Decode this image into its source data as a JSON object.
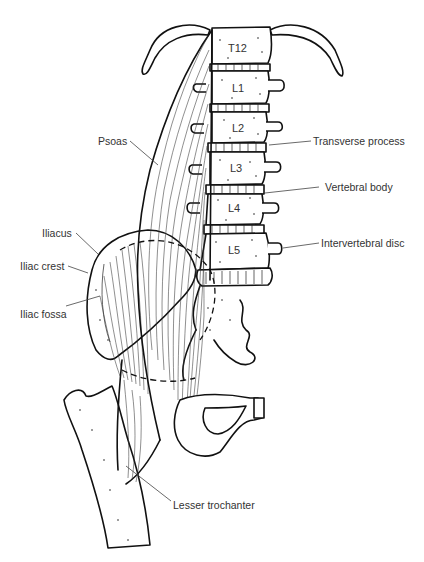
{
  "figure": {
    "vertebrae": [
      "T12",
      "L1",
      "L2",
      "L3",
      "L4",
      "L5"
    ],
    "labels": {
      "psoas": "Psoas",
      "transverse_process": "Transverse process",
      "vertebral_body": "Vertebral body",
      "intervertebral_disc": "Intervertebral disc",
      "iliacus": "Iliacus",
      "iliac_crest": "Iliac crest",
      "iliac_fossa": "Iliac fossa",
      "lesser_trochanter": "Lesser trochanter"
    },
    "colors": {
      "ink": "#111111",
      "label_text": "#333333",
      "background": "#ffffff"
    }
  }
}
